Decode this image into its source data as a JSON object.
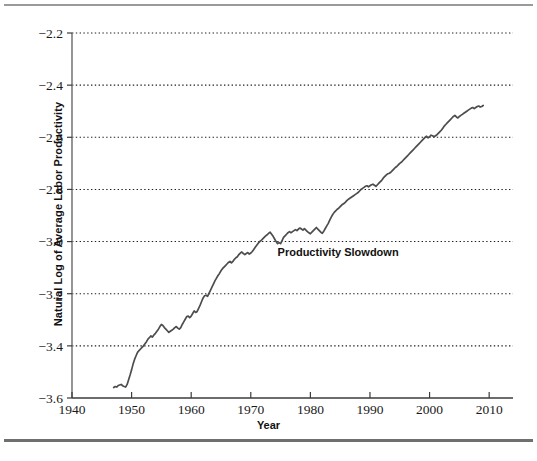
{
  "chart_data": {
    "type": "line",
    "title": "",
    "xlabel": "Year",
    "ylabel": "Natural Log of Average Labor Productivity",
    "xlim": [
      1940,
      2014
    ],
    "ylim": [
      -3.6,
      -2.2
    ],
    "xticks": [
      1940,
      1950,
      1960,
      1970,
      1980,
      1990,
      2000,
      2010
    ],
    "xtick_labels": [
      "1940",
      "1950",
      "1960",
      "1970",
      "1980",
      "1990",
      "2000",
      "2010"
    ],
    "yticks": [
      -3.6,
      -3.4,
      -3.2,
      -3.0,
      -2.8,
      -2.6,
      -2.4,
      -2.2
    ],
    "ytick_labels": [
      "−3.6",
      "−3.4",
      "−3.2",
      "−3.0",
      "−2.8",
      "−2.6",
      "−2.4",
      "−2.2"
    ],
    "grid": "horizontal-dotted",
    "legend": "none",
    "line_color": "#4d4d4d",
    "annotations": [
      {
        "text": "Productivity Slowdown",
        "x": 1974.5,
        "y": -3.055,
        "anchor": "start"
      }
    ],
    "series": [
      {
        "name": "Natural Log of Average Labor Productivity",
        "x": [
          1947.0,
          1947.25,
          1947.5,
          1947.75,
          1948.0,
          1948.25,
          1948.5,
          1948.75,
          1949.0,
          1949.25,
          1949.5,
          1949.75,
          1950.0,
          1950.25,
          1950.5,
          1950.75,
          1951.0,
          1951.25,
          1951.5,
          1951.75,
          1952.0,
          1952.25,
          1952.5,
          1952.75,
          1953.0,
          1953.25,
          1953.5,
          1953.75,
          1954.0,
          1954.25,
          1954.5,
          1954.75,
          1955.0,
          1955.25,
          1955.5,
          1955.75,
          1956.0,
          1956.25,
          1956.5,
          1956.75,
          1957.0,
          1957.25,
          1957.5,
          1957.75,
          1958.0,
          1958.25,
          1958.5,
          1958.75,
          1959.0,
          1959.25,
          1959.5,
          1959.75,
          1960.0,
          1960.25,
          1960.5,
          1960.75,
          1961.0,
          1961.25,
          1961.5,
          1961.75,
          1962.0,
          1962.25,
          1962.5,
          1962.75,
          1963.0,
          1963.25,
          1963.5,
          1963.75,
          1964.0,
          1964.25,
          1964.5,
          1964.75,
          1965.0,
          1965.25,
          1965.5,
          1965.75,
          1966.0,
          1966.25,
          1966.5,
          1966.75,
          1967.0,
          1967.25,
          1967.5,
          1967.75,
          1968.0,
          1968.25,
          1968.5,
          1968.75,
          1969.0,
          1969.25,
          1969.5,
          1969.75,
          1970.0,
          1970.25,
          1970.5,
          1970.75,
          1971.0,
          1971.25,
          1971.5,
          1971.75,
          1972.0,
          1972.25,
          1972.5,
          1972.75,
          1973.0,
          1973.25,
          1973.5,
          1973.75,
          1974.0,
          1974.25,
          1974.5,
          1974.75,
          1975.0,
          1975.25,
          1975.5,
          1975.75,
          1976.0,
          1976.25,
          1976.5,
          1976.75,
          1977.0,
          1977.25,
          1977.5,
          1977.75,
          1978.0,
          1978.25,
          1978.5,
          1978.75,
          1979.0,
          1979.25,
          1979.5,
          1979.75,
          1980.0,
          1980.25,
          1980.5,
          1980.75,
          1981.0,
          1981.25,
          1981.5,
          1981.75,
          1982.0,
          1982.25,
          1982.5,
          1982.75,
          1983.0,
          1983.25,
          1983.5,
          1983.75,
          1984.0,
          1984.25,
          1984.5,
          1984.75,
          1985.0,
          1985.25,
          1985.5,
          1985.75,
          1986.0,
          1986.25,
          1986.5,
          1986.75,
          1987.0,
          1987.25,
          1987.5,
          1987.75,
          1988.0,
          1988.25,
          1988.5,
          1988.75,
          1989.0,
          1989.25,
          1989.5,
          1989.75,
          1990.0,
          1990.25,
          1990.5,
          1990.75,
          1991.0,
          1991.25,
          1991.5,
          1991.75,
          1992.0,
          1992.25,
          1992.5,
          1992.75,
          1993.0,
          1993.25,
          1993.5,
          1993.75,
          1994.0,
          1994.25,
          1994.5,
          1994.75,
          1995.0,
          1995.25,
          1995.5,
          1995.75,
          1996.0,
          1996.25,
          1996.5,
          1996.75,
          1997.0,
          1997.25,
          1997.5,
          1997.75,
          1998.0,
          1998.25,
          1998.5,
          1998.75,
          1999.0,
          1999.25,
          1999.5,
          1999.75,
          2000.0,
          2000.25,
          2000.5,
          2000.75,
          2001.0,
          2001.25,
          2001.5,
          2001.75,
          2002.0,
          2002.25,
          2002.5,
          2002.75,
          2003.0,
          2003.25,
          2003.5,
          2003.75,
          2004.0,
          2004.25,
          2004.5,
          2004.75,
          2005.0,
          2005.25,
          2005.5,
          2005.75,
          2006.0,
          2006.25,
          2006.5,
          2006.75,
          2007.0,
          2007.25,
          2007.5,
          2007.75,
          2008.0,
          2008.25,
          2008.5,
          2008.75,
          2009.0
        ],
        "y": [
          -3.56,
          -3.556,
          -3.558,
          -3.552,
          -3.55,
          -3.548,
          -3.553,
          -3.556,
          -3.558,
          -3.548,
          -3.53,
          -3.512,
          -3.492,
          -3.47,
          -3.452,
          -3.438,
          -3.425,
          -3.418,
          -3.412,
          -3.406,
          -3.4,
          -3.392,
          -3.384,
          -3.374,
          -3.368,
          -3.362,
          -3.366,
          -3.358,
          -3.352,
          -3.344,
          -3.336,
          -3.326,
          -3.318,
          -3.322,
          -3.33,
          -3.336,
          -3.342,
          -3.348,
          -3.344,
          -3.34,
          -3.336,
          -3.33,
          -3.326,
          -3.332,
          -3.336,
          -3.33,
          -3.318,
          -3.308,
          -3.298,
          -3.288,
          -3.286,
          -3.292,
          -3.286,
          -3.276,
          -3.266,
          -3.272,
          -3.268,
          -3.256,
          -3.244,
          -3.23,
          -3.216,
          -3.208,
          -3.206,
          -3.21,
          -3.198,
          -3.186,
          -3.174,
          -3.162,
          -3.15,
          -3.14,
          -3.13,
          -3.122,
          -3.112,
          -3.104,
          -3.098,
          -3.092,
          -3.086,
          -3.08,
          -3.076,
          -3.082,
          -3.076,
          -3.068,
          -3.062,
          -3.058,
          -3.05,
          -3.044,
          -3.04,
          -3.046,
          -3.05,
          -3.046,
          -3.042,
          -3.048,
          -3.044,
          -3.038,
          -3.03,
          -3.022,
          -3.014,
          -3.006,
          -3.0,
          -2.996,
          -2.99,
          -2.984,
          -2.978,
          -2.974,
          -2.968,
          -2.964,
          -2.972,
          -2.98,
          -2.99,
          -3.0,
          -3.008,
          -3.004,
          -3.008,
          -2.996,
          -2.984,
          -2.978,
          -2.972,
          -2.966,
          -2.962,
          -2.966,
          -2.962,
          -2.958,
          -2.954,
          -2.958,
          -2.952,
          -2.948,
          -2.952,
          -2.956,
          -2.95,
          -2.956,
          -2.962,
          -2.966,
          -2.97,
          -2.964,
          -2.958,
          -2.952,
          -2.946,
          -2.952,
          -2.958,
          -2.964,
          -2.968,
          -2.96,
          -2.95,
          -2.94,
          -2.93,
          -2.918,
          -2.906,
          -2.896,
          -2.888,
          -2.882,
          -2.876,
          -2.872,
          -2.866,
          -2.86,
          -2.856,
          -2.852,
          -2.846,
          -2.84,
          -2.836,
          -2.832,
          -2.828,
          -2.824,
          -2.82,
          -2.816,
          -2.812,
          -2.806,
          -2.8,
          -2.796,
          -2.792,
          -2.788,
          -2.786,
          -2.79,
          -2.786,
          -2.782,
          -2.78,
          -2.784,
          -2.788,
          -2.782,
          -2.776,
          -2.77,
          -2.764,
          -2.756,
          -2.75,
          -2.744,
          -2.74,
          -2.738,
          -2.734,
          -2.728,
          -2.722,
          -2.716,
          -2.712,
          -2.706,
          -2.7,
          -2.696,
          -2.69,
          -2.684,
          -2.678,
          -2.672,
          -2.666,
          -2.66,
          -2.654,
          -2.648,
          -2.642,
          -2.636,
          -2.63,
          -2.624,
          -2.618,
          -2.612,
          -2.606,
          -2.6,
          -2.596,
          -2.602,
          -2.598,
          -2.592,
          -2.594,
          -2.598,
          -2.594,
          -2.59,
          -2.584,
          -2.578,
          -2.572,
          -2.564,
          -2.556,
          -2.55,
          -2.544,
          -2.538,
          -2.532,
          -2.526,
          -2.52,
          -2.516,
          -2.522,
          -2.526,
          -2.52,
          -2.516,
          -2.512,
          -2.508,
          -2.504,
          -2.5,
          -2.496,
          -2.492,
          -2.488,
          -2.486,
          -2.49,
          -2.486,
          -2.482,
          -2.48,
          -2.484,
          -2.482,
          -2.478
        ]
      }
    ]
  }
}
